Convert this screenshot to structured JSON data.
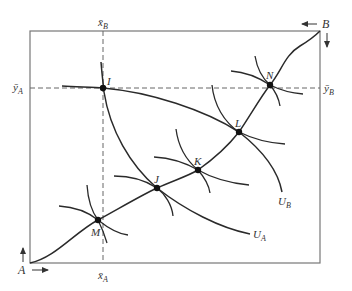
{
  "diagram": {
    "type": "edgeworth-box",
    "origins": {
      "A": "A",
      "B": "B"
    },
    "endowment_labels": {
      "x_A": "x̄",
      "x_A_sub": "A",
      "x_B": "x̄",
      "x_B_sub": "B",
      "y_A": "ȳ",
      "y_A_sub": "A",
      "y_B": "ȳ",
      "y_B_sub": "B"
    },
    "points": [
      {
        "name": "I",
        "x": 103,
        "y": 88
      },
      {
        "name": "J",
        "x": 157,
        "y": 188
      },
      {
        "name": "K",
        "x": 198,
        "y": 170
      },
      {
        "name": "L",
        "x": 239,
        "y": 132
      },
      {
        "name": "M",
        "x": 98,
        "y": 220
      },
      {
        "name": "N",
        "x": 270,
        "y": 85
      }
    ],
    "curves": {
      "U_A": "U",
      "U_A_sub": "A",
      "U_B": "U",
      "U_B_sub": "B"
    },
    "colors": {
      "line": "#2a2a2a",
      "box": "#777777",
      "dash": "#666666"
    }
  }
}
